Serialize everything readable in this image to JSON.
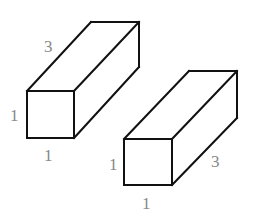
{
  "figure": {
    "colors": {
      "edges": "#111111",
      "labels": "#888888",
      "background": "#ffffff"
    },
    "prisms": [
      {
        "id": "prism-left",
        "orientation": "length receding upward-right",
        "labels": {
          "length": "3",
          "height": "1",
          "width": "1"
        }
      },
      {
        "id": "prism-right",
        "orientation": "length receding upward-right",
        "labels": {
          "height": "1",
          "width": "1",
          "length": "3"
        }
      }
    ]
  }
}
